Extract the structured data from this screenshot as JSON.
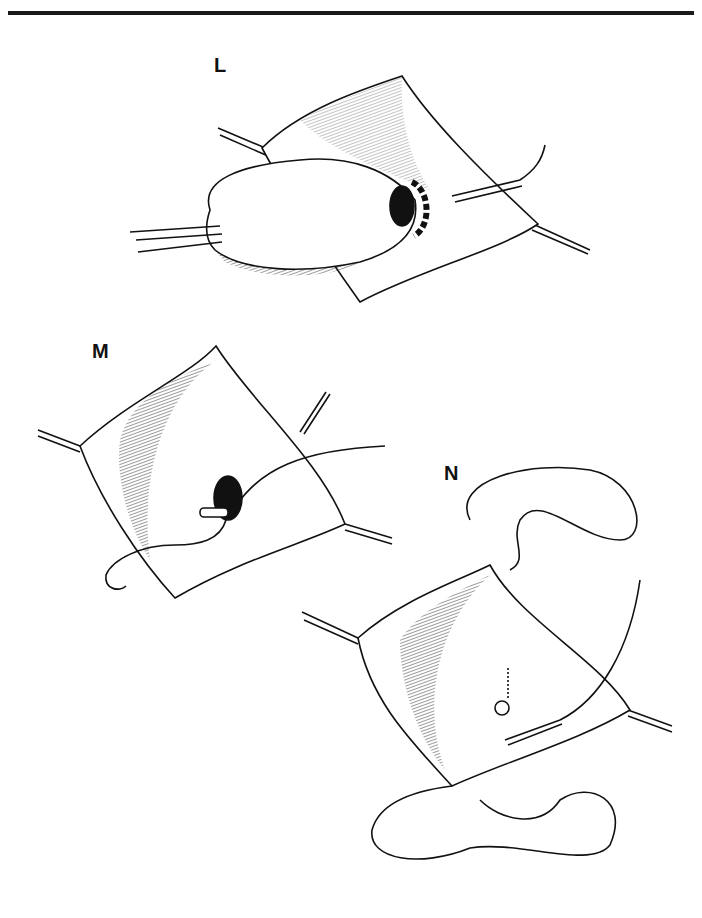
{
  "figure": {
    "panels": [
      {
        "label": "L",
        "description": "Bowel segment retracted through opening in bladder wall with dashed incision ring around dark stoma"
      },
      {
        "label": "M",
        "description": "Opened bladder wall with tube/catheter inserted through dark opening, suture passing through"
      },
      {
        "label": "N",
        "description": "Closed bladder wall with sutured stoma, catheter, and looping suture threads at top and bottom corners"
      }
    ]
  },
  "colors": {
    "ink": "#111111",
    "background": "#ffffff"
  }
}
